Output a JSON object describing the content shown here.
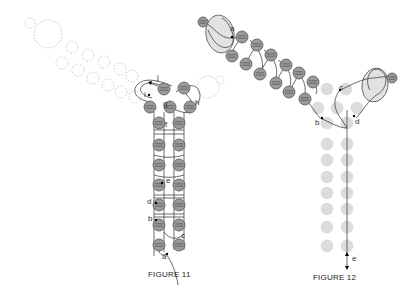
{
  "figures": [
    {
      "id": "figure-11",
      "caption": "FIGURE 11",
      "caption_pos": [
        148,
        277
      ],
      "colors": {
        "bead_fill": "#9a9a9a",
        "bead_stroke": "#555555",
        "ghost_stroke": "#bdbdbd",
        "thread": "#444444"
      },
      "ghost_beads": [
        {
          "cx": 30,
          "cy": 23,
          "r": 5
        },
        {
          "cx": 48,
          "cy": 34,
          "r": 14
        },
        {
          "cx": 72,
          "cy": 47,
          "r": 6
        },
        {
          "cx": 88,
          "cy": 55,
          "r": 6
        },
        {
          "cx": 104,
          "cy": 62,
          "r": 6
        },
        {
          "cx": 120,
          "cy": 69,
          "r": 6
        },
        {
          "cx": 132,
          "cy": 76,
          "r": 6
        },
        {
          "cx": 62,
          "cy": 63,
          "r": 6
        },
        {
          "cx": 78,
          "cy": 70,
          "r": 6
        },
        {
          "cx": 93,
          "cy": 78,
          "r": 6
        },
        {
          "cx": 108,
          "cy": 85,
          "r": 6
        },
        {
          "cx": 121,
          "cy": 92,
          "r": 6
        },
        {
          "cx": 135,
          "cy": 97,
          "r": 6
        },
        {
          "cx": 208,
          "cy": 87,
          "r": 11
        },
        {
          "cx": 220,
          "cy": 80,
          "r": 4
        }
      ],
      "beads": [
        {
          "cx": 164,
          "cy": 89,
          "r": 6
        },
        {
          "cx": 184,
          "cy": 88,
          "r": 6
        },
        {
          "cx": 150,
          "cy": 107,
          "r": 6
        },
        {
          "cx": 170,
          "cy": 107,
          "r": 6
        },
        {
          "cx": 190,
          "cy": 107,
          "r": 6
        },
        {
          "cx": 159,
          "cy": 123,
          "r": 6
        },
        {
          "cx": 179,
          "cy": 123,
          "r": 6
        },
        {
          "cx": 159,
          "cy": 145,
          "r": 6
        },
        {
          "cx": 179,
          "cy": 145,
          "r": 6
        },
        {
          "cx": 159,
          "cy": 165,
          "r": 6
        },
        {
          "cx": 179,
          "cy": 165,
          "r": 6
        },
        {
          "cx": 159,
          "cy": 185,
          "r": 6
        },
        {
          "cx": 179,
          "cy": 185,
          "r": 6
        },
        {
          "cx": 159,
          "cy": 205,
          "r": 6
        },
        {
          "cx": 179,
          "cy": 205,
          "r": 6
        },
        {
          "cx": 159,
          "cy": 225,
          "r": 6
        },
        {
          "cx": 179,
          "cy": 225,
          "r": 6
        },
        {
          "cx": 159,
          "cy": 245,
          "r": 6
        },
        {
          "cx": 179,
          "cy": 245,
          "r": 6
        }
      ],
      "labels": [
        {
          "text": "j",
          "x": 157,
          "y": 80
        },
        {
          "text": "i",
          "x": 144,
          "y": 97
        },
        {
          "text": "g",
          "x": 163,
          "y": 106
        },
        {
          "text": "h",
          "x": 195,
          "y": 105
        },
        {
          "text": "f",
          "x": 165,
          "y": 127
        },
        {
          "text": "e",
          "x": 166,
          "y": 183
        },
        {
          "text": "d",
          "x": 147,
          "y": 204
        },
        {
          "text": "b",
          "x": 148,
          "y": 221
        },
        {
          "text": "c",
          "x": 181,
          "y": 238
        },
        {
          "text": "a",
          "x": 162,
          "y": 259
        }
      ],
      "thread_points": [
        {
          "x": 149,
          "y": 95
        },
        {
          "x": 162,
          "y": 203
        },
        {
          "x": 157,
          "y": 219
        },
        {
          "x": 166,
          "y": 254
        },
        {
          "x": 167,
          "y": 181
        }
      ]
    },
    {
      "id": "figure-12",
      "caption": "FIGURE 12",
      "caption_pos": [
        313,
        280
      ],
      "colors": {
        "bead_fill": "#9a9a9a",
        "bead_stroke": "#555555",
        "faded_fill": "#dcdcdc",
        "ellipse_fill": "#e2e2e2",
        "thread": "#444444"
      },
      "ellipses": [
        {
          "cx": 220,
          "cy": 34,
          "rx": 14,
          "ry": 19,
          "rot": -10
        },
        {
          "cx": 375,
          "cy": 85,
          "rx": 13,
          "ry": 17,
          "rot": 10
        }
      ],
      "beads": [
        {
          "cx": 203,
          "cy": 22,
          "r": 5
        },
        {
          "cx": 392,
          "cy": 78,
          "r": 5
        },
        {
          "cx": 242,
          "cy": 37,
          "r": 6
        },
        {
          "cx": 257,
          "cy": 45,
          "r": 6
        },
        {
          "cx": 271,
          "cy": 55,
          "r": 6
        },
        {
          "cx": 286,
          "cy": 65,
          "r": 6
        },
        {
          "cx": 299,
          "cy": 73,
          "r": 6
        },
        {
          "cx": 313,
          "cy": 82,
          "r": 6
        },
        {
          "cx": 232,
          "cy": 56,
          "r": 6
        },
        {
          "cx": 246,
          "cy": 64,
          "r": 6
        },
        {
          "cx": 260,
          "cy": 74,
          "r": 6
        },
        {
          "cx": 276,
          "cy": 83,
          "r": 6
        },
        {
          "cx": 289,
          "cy": 92,
          "r": 6
        },
        {
          "cx": 305,
          "cy": 99,
          "r": 6
        }
      ],
      "faded_beads": [
        {
          "cx": 327,
          "cy": 89
        },
        {
          "cx": 346,
          "cy": 89
        },
        {
          "cx": 318,
          "cy": 108
        },
        {
          "cx": 337,
          "cy": 108
        },
        {
          "cx": 357,
          "cy": 108
        },
        {
          "cx": 327,
          "cy": 123
        },
        {
          "cx": 347,
          "cy": 123
        },
        {
          "cx": 327,
          "cy": 144
        },
        {
          "cx": 347,
          "cy": 144
        },
        {
          "cx": 327,
          "cy": 160
        },
        {
          "cx": 347,
          "cy": 160
        },
        {
          "cx": 327,
          "cy": 177
        },
        {
          "cx": 347,
          "cy": 177
        },
        {
          "cx": 327,
          "cy": 193
        },
        {
          "cx": 347,
          "cy": 193
        },
        {
          "cx": 327,
          "cy": 209
        },
        {
          "cx": 347,
          "cy": 209
        },
        {
          "cx": 327,
          "cy": 227
        },
        {
          "cx": 347,
          "cy": 227
        },
        {
          "cx": 327,
          "cy": 246
        },
        {
          "cx": 347,
          "cy": 246
        }
      ],
      "labels": [
        {
          "text": "a",
          "x": 230,
          "y": 31
        },
        {
          "text": "c",
          "x": 339,
          "y": 90
        },
        {
          "text": "b",
          "x": 315,
          "y": 125
        },
        {
          "text": "d",
          "x": 355,
          "y": 124
        },
        {
          "text": "e",
          "x": 352,
          "y": 261
        }
      ]
    }
  ]
}
